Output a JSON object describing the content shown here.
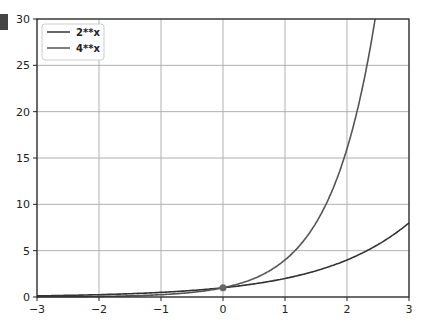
{
  "chart_data": {
    "type": "line",
    "title": "",
    "xlabel": "",
    "ylabel": "",
    "xlim": [
      -3,
      3
    ],
    "ylim": [
      0,
      30
    ],
    "grid": true,
    "legend_position": "upper left",
    "xticks": [
      "−3",
      "−2",
      "−1",
      "0",
      "1",
      "2",
      "3"
    ],
    "yticks": [
      "0",
      "5",
      "10",
      "15",
      "20",
      "25",
      "30"
    ],
    "series": [
      {
        "name": "2**x",
        "color": "#333333",
        "x": [
          -3,
          -2,
          -1,
          0,
          1,
          2,
          3
        ],
        "values": [
          0.125,
          0.25,
          0.5,
          1,
          2,
          4,
          8
        ]
      },
      {
        "name": "4**x",
        "color": "#555555",
        "x": [
          -3,
          -2,
          -1,
          0,
          1,
          2,
          2.45
        ],
        "values": [
          0.016,
          0.0625,
          0.25,
          1,
          4,
          16,
          30
        ]
      }
    ],
    "annotations": [
      {
        "type": "point",
        "x": 0,
        "y": 1
      }
    ]
  }
}
